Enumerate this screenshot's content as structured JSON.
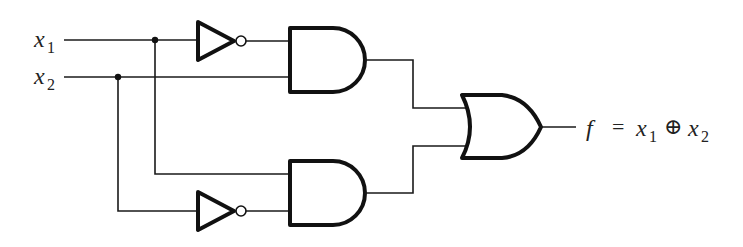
{
  "diagram": {
    "type": "logic-circuit",
    "inputs": [
      {
        "name": "x",
        "subscript": "1"
      },
      {
        "name": "x",
        "subscript": "2"
      }
    ],
    "gates": [
      {
        "id": "not_top",
        "type": "NOT",
        "input": "x1"
      },
      {
        "id": "and_top",
        "type": "AND",
        "inputs": [
          "NOT x1",
          "x2"
        ]
      },
      {
        "id": "not_bottom",
        "type": "NOT",
        "input": "x2"
      },
      {
        "id": "and_bottom",
        "type": "AND",
        "inputs": [
          "x1",
          "NOT x2"
        ]
      },
      {
        "id": "or_out",
        "type": "OR",
        "inputs": [
          "and_top",
          "and_bottom"
        ]
      }
    ],
    "output": {
      "name": "f",
      "equals": "=",
      "lhs_var": "x",
      "lhs_sub": "1",
      "operator": "⊕",
      "rhs_var": "x",
      "rhs_sub": "2"
    }
  }
}
